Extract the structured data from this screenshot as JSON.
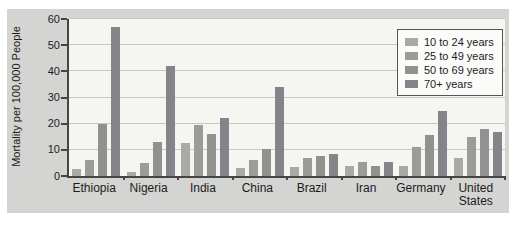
{
  "figure": {
    "panel_background": "#d4d4d2",
    "plot_background": "#f5f5f2"
  },
  "chart_data": {
    "type": "bar",
    "title": "",
    "xlabel": "",
    "ylabel": "Mortality per 100,000 People",
    "ylim": [
      0,
      60
    ],
    "yticks": [
      0,
      10,
      20,
      30,
      40,
      50,
      60
    ],
    "grid": true,
    "legend_position": "top-right",
    "categories": [
      "Ethiopia",
      "Nigeria",
      "India",
      "China",
      "Brazil",
      "Iran",
      "Germany",
      "United States"
    ],
    "series": [
      {
        "name": "10 to 24 years",
        "color": "#a9aaa5",
        "values": [
          2.5,
          1.5,
          12.5,
          3,
          3.5,
          4,
          4,
          7
        ]
      },
      {
        "name": "25 to 49 years",
        "color": "#9b9c97",
        "values": [
          6,
          5,
          19.5,
          6,
          7,
          5.5,
          11,
          15
        ]
      },
      {
        "name": "50 to 69 years",
        "color": "#919290",
        "values": [
          20,
          13,
          16,
          10.5,
          7.5,
          4,
          15.5,
          18
        ]
      },
      {
        "name": "70+ years",
        "color": "#84858a",
        "values": [
          57,
          42,
          22,
          34,
          8.5,
          5.5,
          25,
          17
        ]
      }
    ]
  }
}
